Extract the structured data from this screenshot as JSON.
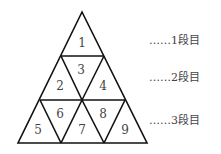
{
  "diagram": {
    "cells": [
      "1",
      "2",
      "3",
      "4",
      "5",
      "6",
      "7",
      "8",
      "9"
    ],
    "row_labels": [
      "……1段目",
      "……2段目",
      "……3段目"
    ],
    "line_color": "#111111"
  }
}
